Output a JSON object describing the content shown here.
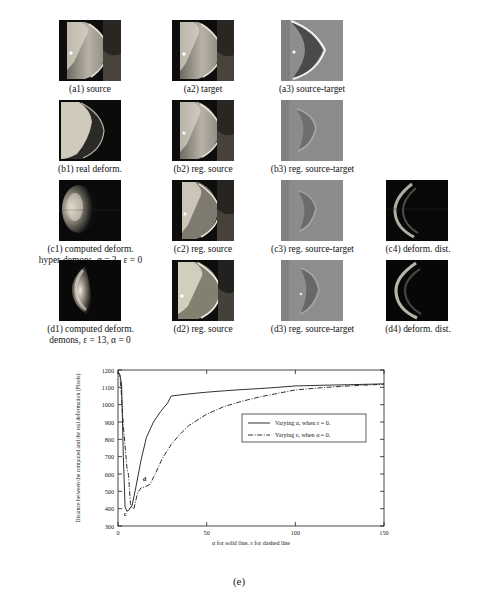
{
  "figure": {
    "subfigure_label": "(e)"
  },
  "panels": [
    {
      "id": "a1",
      "caption": "(a1) source",
      "caption2": "",
      "row": 0,
      "col": 0
    },
    {
      "id": "a2",
      "caption": "(a2) target",
      "caption2": "",
      "row": 0,
      "col": 1
    },
    {
      "id": "a3",
      "caption": "(a3) source-target",
      "caption2": "",
      "row": 0,
      "col": 2
    },
    {
      "id": "b1",
      "caption": "(b1) real deform.",
      "caption2": "",
      "row": 1,
      "col": 0
    },
    {
      "id": "b2",
      "caption": "(b2) reg. source",
      "caption2": "",
      "row": 1,
      "col": 1
    },
    {
      "id": "b3",
      "caption": "(b3) reg. source-target",
      "caption2": "",
      "row": 1,
      "col": 2
    },
    {
      "id": "c1",
      "caption": "(c1) computed deform.",
      "caption2": "hyper-demons, α = 2 , ε = 0",
      "row": 2,
      "col": 0
    },
    {
      "id": "c2",
      "caption": "(c2) reg. source",
      "caption2": "",
      "row": 2,
      "col": 1
    },
    {
      "id": "c3",
      "caption": "(c3) reg. source-target",
      "caption2": "",
      "row": 2,
      "col": 2
    },
    {
      "id": "c4",
      "caption": "(c4) deform. dist.",
      "caption2": "",
      "row": 2,
      "col": 3
    },
    {
      "id": "d1",
      "caption": "(d1) computed deform.",
      "caption2": "demons, ε = 13, α = 0",
      "row": 3,
      "col": 0
    },
    {
      "id": "d2",
      "caption": "(d2) reg. source",
      "caption2": "",
      "row": 3,
      "col": 1
    },
    {
      "id": "d3",
      "caption": "(d3) reg. source-target",
      "caption2": "",
      "row": 3,
      "col": 2
    },
    {
      "id": "d4",
      "caption": "(d4) deform. dist.",
      "caption2": "",
      "row": 3,
      "col": 3
    }
  ],
  "chart_data": {
    "type": "line",
    "title": "",
    "xlabel": "α for solid line, ε for dashed line",
    "ylabel": "Distance between the computed and the real deformation (Pixels)",
    "xlim": [
      0,
      150
    ],
    "ylim": [
      300,
      1200
    ],
    "xticks": [
      0,
      50,
      100,
      150
    ],
    "yticks": [
      300,
      400,
      500,
      600,
      700,
      800,
      900,
      1000,
      1100,
      1200
    ],
    "grid": false,
    "legend_position": "center-right",
    "annotations": [
      {
        "text": "c",
        "x": 4,
        "y": 360
      },
      {
        "text": "d",
        "x": 15,
        "y": 560
      }
    ],
    "series": [
      {
        "name": "Varying α, when ε = 0.",
        "style": "solid",
        "x": [
          0,
          1,
          2,
          3,
          4,
          5,
          6,
          8,
          10,
          13,
          16,
          20,
          24,
          28,
          30,
          40,
          50,
          60,
          70,
          80,
          90,
          100,
          115,
          130,
          150
        ],
        "values": [
          1190,
          1175,
          1120,
          700,
          410,
          385,
          390,
          420,
          520,
          680,
          810,
          900,
          960,
          1010,
          1050,
          1062,
          1072,
          1080,
          1087,
          1093,
          1100,
          1108,
          1112,
          1115,
          1120
        ]
      },
      {
        "name": "Varying ε, when α = 0.",
        "style": "dash-dot",
        "x": [
          0,
          1,
          2,
          3,
          4,
          5,
          6,
          7,
          8,
          9,
          11,
          13,
          15,
          18,
          21,
          25,
          30,
          35,
          40,
          50,
          60,
          70,
          80,
          90,
          100,
          115,
          130,
          150
        ],
        "values": [
          1185,
          1170,
          1050,
          880,
          760,
          640,
          590,
          430,
          405,
          400,
          490,
          520,
          525,
          540,
          600,
          690,
          770,
          830,
          880,
          945,
          990,
          1020,
          1045,
          1065,
          1085,
          1098,
          1108,
          1118
        ]
      }
    ]
  }
}
